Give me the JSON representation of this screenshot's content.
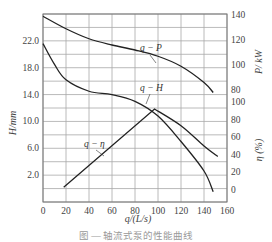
{
  "chart_data": {
    "type": "line",
    "title": "",
    "xlabel": "q/(L/s)",
    "xlim": [
      0,
      160
    ],
    "x_ticks": [
      0,
      20,
      40,
      60,
      80,
      100,
      120,
      140,
      160
    ],
    "left_axis": {
      "label": "H/mm",
      "ticks": [
        2.0,
        6.0,
        10.0,
        14.0,
        18.0,
        22.0
      ],
      "tick_labels": [
        "2.0",
        "6.0",
        "10.0",
        "14.0",
        "18.0",
        "22.0"
      ]
    },
    "right_axis_power": {
      "label": "P/kW",
      "ticks": [
        80,
        100,
        120,
        140
      ],
      "tick_labels": [
        "80",
        "100",
        "120",
        "140"
      ]
    },
    "right_axis_efficiency": {
      "label": "η(%)",
      "ticks": [
        0,
        20,
        40,
        60,
        80,
        100
      ],
      "tick_labels": [
        "0",
        "20",
        "40",
        "60",
        "80",
        "100"
      ]
    },
    "grid": true,
    "series": [
      {
        "name": "q-P",
        "axis": "P/kW",
        "x": [
          0,
          20,
          40,
          60,
          80,
          100,
          120,
          140,
          148
        ],
        "values": [
          139,
          129,
          121,
          116,
          112,
          107,
          99,
          86,
          78
        ]
      },
      {
        "name": "q-H",
        "axis": "H/mm",
        "x": [
          0,
          10,
          20,
          40,
          60,
          80,
          100,
          120,
          140,
          148
        ],
        "values": [
          21.6,
          18.5,
          16.2,
          14.5,
          14.0,
          13.0,
          10.8,
          7.0,
          2.6,
          -0.5
        ]
      },
      {
        "name": "q-η",
        "axis": "η(%)",
        "x": [
          18,
          40,
          60,
          80,
          97,
          120,
          140,
          152
        ],
        "values": [
          3,
          32,
          56,
          78,
          92,
          73,
          50,
          38
        ]
      }
    ],
    "annotations": [
      "q−P",
      "q−H",
      "q−η"
    ]
  },
  "labels": {
    "ylabel_left": "H/mm",
    "ylabel_right_power": "P/ kW",
    "ylabel_right_eff": "η (%)",
    "xlabel": "q/(L/s)",
    "curve_p": "q − P",
    "curve_h": "q − H",
    "curve_eta": "q − η",
    "caption": "图 — 轴流式泵的性能曲线"
  },
  "colors": {
    "grid": "#a8a8a8",
    "curve": "#222222",
    "text": "#444444"
  }
}
